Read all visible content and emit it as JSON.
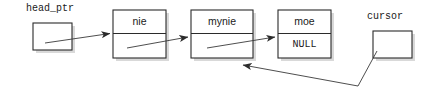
{
  "diagram": {
    "colors": {
      "background": "#ffffff",
      "box_border": "#2b2b2b",
      "box_fill": "#ffffff",
      "box_shadow": "#d6d6d6",
      "line": "#3a3a3a",
      "text": "#1a1a1a"
    },
    "pointer_labels": [
      {
        "name": "head_ptr",
        "text": "head_ptr"
      },
      {
        "name": "cursor",
        "text": "cursor"
      }
    ],
    "nodes": [
      {
        "name": "node-nie",
        "data": "nie",
        "link": ""
      },
      {
        "name": "node-mynie",
        "data": "mynie",
        "link": ""
      },
      {
        "name": "node-moe",
        "data": "moe",
        "link": "NULL"
      }
    ],
    "labels": {
      "head_ptr": "head_ptr",
      "cursor": "cursor",
      "node1_data": "nie",
      "node2_data": "mynie",
      "node3_data": "moe",
      "node3_link": "NULL"
    }
  }
}
